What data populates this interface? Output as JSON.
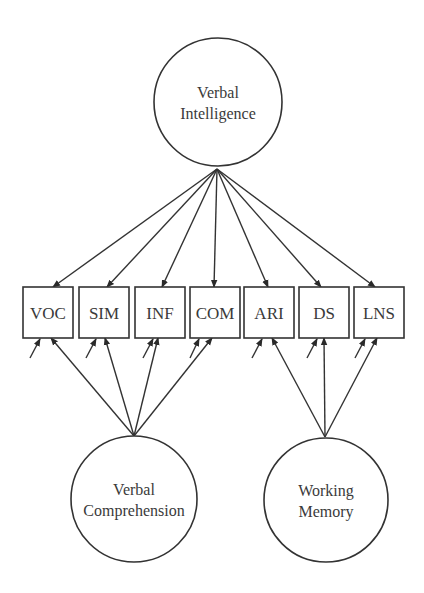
{
  "diagram": {
    "type": "structural-equation-model",
    "colors": {
      "stroke": "#333333",
      "text": "#3a3a3a",
      "background": "#ffffff"
    },
    "latent_factors": [
      {
        "id": "VI",
        "label_lines": [
          "Verbal",
          "Intelligence"
        ],
        "cx": 218,
        "cy": 102,
        "r": 64
      },
      {
        "id": "VC",
        "label_lines": [
          "Verbal",
          "Comprehension"
        ],
        "cx": 134,
        "cy": 499,
        "r": 63
      },
      {
        "id": "WM",
        "label_lines": [
          "Working",
          "Memory"
        ],
        "cx": 326,
        "cy": 500,
        "r": 62
      }
    ],
    "observed_variables": [
      {
        "id": "VOC",
        "label": "VOC",
        "x": 23,
        "y": 287,
        "w": 50,
        "h": 51
      },
      {
        "id": "SIM",
        "label": "SIM",
        "x": 79,
        "y": 287,
        "w": 50,
        "h": 51
      },
      {
        "id": "INF",
        "label": "INF",
        "x": 135,
        "y": 287,
        "w": 50,
        "h": 51
      },
      {
        "id": "COM",
        "label": "COM",
        "x": 190,
        "y": 287,
        "w": 50,
        "h": 51
      },
      {
        "id": "ARI",
        "label": "ARI",
        "x": 244,
        "y": 287,
        "w": 50,
        "h": 51
      },
      {
        "id": "DS",
        "label": "DS",
        "x": 299,
        "y": 287,
        "w": 50,
        "h": 51
      },
      {
        "id": "LNS",
        "label": "LNS",
        "x": 354,
        "y": 287,
        "w": 50,
        "h": 51
      }
    ],
    "paths": [
      {
        "from": "VI",
        "to": "VOC",
        "x1": 217,
        "y1": 169,
        "x2": 53,
        "y2": 287
      },
      {
        "from": "VI",
        "to": "SIM",
        "x1": 217,
        "y1": 169,
        "x2": 107,
        "y2": 287
      },
      {
        "from": "VI",
        "to": "INF",
        "x1": 217,
        "y1": 169,
        "x2": 162,
        "y2": 287
      },
      {
        "from": "VI",
        "to": "COM",
        "x1": 217,
        "y1": 169,
        "x2": 214,
        "y2": 287
      },
      {
        "from": "VI",
        "to": "ARI",
        "x1": 217,
        "y1": 169,
        "x2": 268,
        "y2": 287
      },
      {
        "from": "VI",
        "to": "DS",
        "x1": 217,
        "y1": 169,
        "x2": 321,
        "y2": 287
      },
      {
        "from": "VI",
        "to": "LNS",
        "x1": 217,
        "y1": 169,
        "x2": 375,
        "y2": 287
      },
      {
        "from": "VC",
        "to": "VOC",
        "x1": 134,
        "y1": 436,
        "x2": 51,
        "y2": 338
      },
      {
        "from": "VC",
        "to": "SIM",
        "x1": 134,
        "y1": 436,
        "x2": 105,
        "y2": 338
      },
      {
        "from": "VC",
        "to": "INF",
        "x1": 134,
        "y1": 436,
        "x2": 158,
        "y2": 338
      },
      {
        "from": "VC",
        "to": "COM",
        "x1": 134,
        "y1": 436,
        "x2": 212,
        "y2": 338
      },
      {
        "from": "WM",
        "to": "ARI",
        "x1": 325,
        "y1": 437,
        "x2": 272,
        "y2": 338
      },
      {
        "from": "WM",
        "to": "DS",
        "x1": 325,
        "y1": 437,
        "x2": 324,
        "y2": 338
      },
      {
        "from": "WM",
        "to": "LNS",
        "x1": 325,
        "y1": 437,
        "x2": 377,
        "y2": 338
      }
    ],
    "error_terms": [
      {
        "to": "VOC",
        "x1": 30,
        "y1": 358,
        "x2": 40,
        "y2": 339
      },
      {
        "to": "SIM",
        "x1": 86,
        "y1": 358,
        "x2": 96,
        "y2": 339
      },
      {
        "to": "INF",
        "x1": 143,
        "y1": 358,
        "x2": 153,
        "y2": 339
      },
      {
        "to": "COM",
        "x1": 190,
        "y1": 358,
        "x2": 199,
        "y2": 339
      },
      {
        "to": "ARI",
        "x1": 252,
        "y1": 358,
        "x2": 262,
        "y2": 339
      },
      {
        "to": "DS",
        "x1": 307,
        "y1": 358,
        "x2": 317,
        "y2": 339
      },
      {
        "to": "LNS",
        "x1": 355,
        "y1": 358,
        "x2": 365,
        "y2": 339
      }
    ]
  }
}
